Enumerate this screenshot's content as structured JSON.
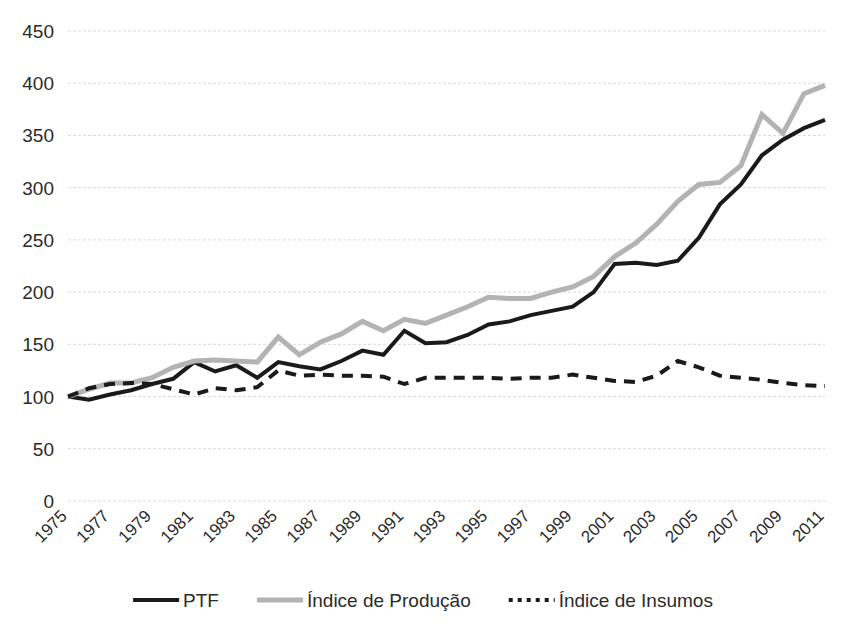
{
  "chart_data": {
    "type": "line",
    "title": "",
    "xlabel": "",
    "ylabel": "",
    "ylim": [
      0,
      450
    ],
    "ytick_step": 50,
    "yticks": [
      0,
      50,
      100,
      150,
      200,
      250,
      300,
      350,
      400,
      450
    ],
    "grid": true,
    "legend_position": "bottom",
    "x": [
      1975,
      1976,
      1977,
      1978,
      1979,
      1980,
      1981,
      1982,
      1983,
      1984,
      1985,
      1986,
      1987,
      1988,
      1989,
      1990,
      1991,
      1992,
      1993,
      1994,
      1995,
      1996,
      1997,
      1998,
      1999,
      2000,
      2001,
      2002,
      2003,
      2004,
      2005,
      2006,
      2007,
      2008,
      2009,
      2010,
      2011
    ],
    "xtick_labels": [
      "1975",
      "1977",
      "1979",
      "1981",
      "1983",
      "1985",
      "1987",
      "1989",
      "1991",
      "1993",
      "1995",
      "1997",
      "1999",
      "2001",
      "2003",
      "2005",
      "2007",
      "2009",
      "2011"
    ],
    "series": [
      {
        "name": "PTF",
        "color": "#1a1a1a",
        "style": "solid",
        "width": 4,
        "values": [
          100,
          97,
          102,
          106,
          112,
          117,
          133,
          124,
          130,
          118,
          133,
          129,
          126,
          134,
          144,
          140,
          163,
          151,
          152,
          159,
          169,
          172,
          178,
          182,
          186,
          200,
          227,
          228,
          226,
          230,
          252,
          284,
          303,
          331,
          346,
          357,
          365
        ]
      },
      {
        "name": "Índice de Produção",
        "color": "#b3b3b3",
        "style": "solid",
        "width": 5,
        "values": [
          100,
          107,
          113,
          113,
          118,
          128,
          134,
          135,
          134,
          133,
          157,
          140,
          152,
          160,
          172,
          163,
          174,
          170,
          178,
          186,
          195,
          194,
          194,
          200,
          205,
          215,
          234,
          247,
          265,
          287,
          303,
          305,
          321,
          370,
          352,
          390,
          398
        ]
      },
      {
        "name": "Índice de Insumos",
        "color": "#1a1a1a",
        "style": "dashed",
        "width": 4,
        "values": [
          100,
          108,
          112,
          113,
          112,
          107,
          102,
          108,
          106,
          109,
          125,
          120,
          121,
          120,
          120,
          119,
          112,
          118,
          118,
          118,
          118,
          117,
          118,
          118,
          121,
          118,
          115,
          114,
          120,
          134,
          128,
          120,
          118,
          116,
          113,
          111,
          110
        ]
      }
    ]
  }
}
